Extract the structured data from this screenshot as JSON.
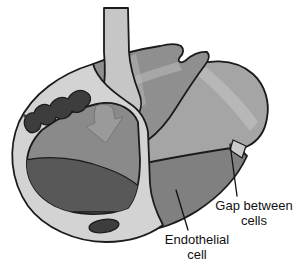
{
  "labels": {
    "gap_between_cells": {
      "line1": "Gap between",
      "line2": "cells"
    },
    "endothelial_cell": {
      "line1": "Endothelial",
      "line2": "cell"
    }
  },
  "colors": {
    "background": "#ffffff",
    "outline": "#1b1b1b",
    "flow_arrow": "#c6c6c6",
    "cut_wall_ring": "#d3d3d3",
    "top_cell": "#8f8f8f",
    "side_cell": "#a5a5a5",
    "bottom_cell": "#808080",
    "surface_band": "#bcbcbc",
    "lumen": "#8a8a8a",
    "lumen_shadow": "#585858",
    "ghost_arrow": "#9c9c9c",
    "nucleus": "#3d3d3d",
    "gap_notch": "#cbcbcb"
  }
}
